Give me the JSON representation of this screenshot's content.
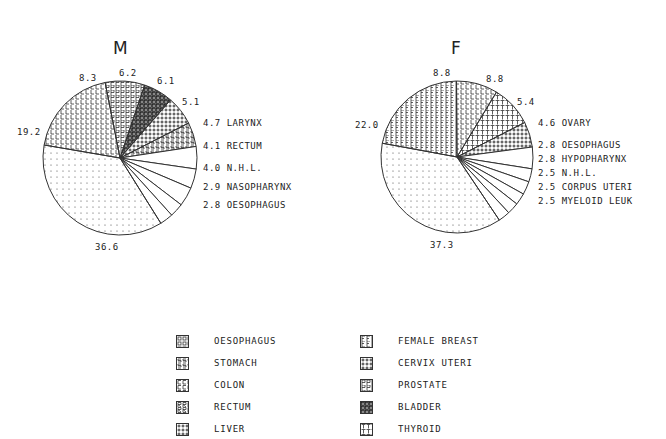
{
  "chart_data": [
    {
      "type": "pie",
      "title": "M",
      "slices": [
        {
          "label": "STOMACH",
          "value": 5.1,
          "pattern": "S"
        },
        {
          "label": "LARYNX",
          "value": 4.7,
          "pattern": "none"
        },
        {
          "label": "RECTUM",
          "value": 4.1,
          "pattern": "none"
        },
        {
          "label": "N.H.L.",
          "value": 4.0,
          "pattern": "none"
        },
        {
          "label": "NASOPHARYNX",
          "value": 2.9,
          "pattern": "none"
        },
        {
          "label": "OESOPHAGUS",
          "value": 2.8,
          "pattern": "none"
        },
        {
          "label": "Other",
          "value": 36.6,
          "pattern": "dots"
        },
        {
          "label": "LUNG",
          "value": 19.2,
          "pattern": "L"
        },
        {
          "label": "PROSTATE",
          "value": 8.3,
          "pattern": "P"
        },
        {
          "label": "BLADDER",
          "value": 6.2,
          "pattern": "B"
        },
        {
          "label": "LIVER",
          "value": 6.1,
          "pattern": "plus"
        }
      ]
    },
    {
      "type": "pie",
      "title": "F",
      "slices": [
        {
          "label": "CERVIX UTERI",
          "value": 5.4,
          "pattern": "plus"
        },
        {
          "label": "OVARY",
          "value": 4.6,
          "pattern": "none"
        },
        {
          "label": "OESOPHAGUS",
          "value": 2.8,
          "pattern": "none"
        },
        {
          "label": "HYPOPHARYNX",
          "value": 2.8,
          "pattern": "none"
        },
        {
          "label": "N.H.L.",
          "value": 2.5,
          "pattern": "none"
        },
        {
          "label": "CORPUS UTERI",
          "value": 2.5,
          "pattern": "none"
        },
        {
          "label": "MYELOID LEUK",
          "value": 2.5,
          "pattern": "none"
        },
        {
          "label": "Other",
          "value": 37.3,
          "pattern": "dots"
        },
        {
          "label": "FEMALE BREAST",
          "value": 22.0,
          "pattern": "F"
        },
        {
          "label": "LUNG",
          "value": 8.8,
          "pattern": "L"
        },
        {
          "label": "THYROID",
          "value": 8.8,
          "pattern": "T"
        }
      ]
    }
  ],
  "titles": {
    "male": "M",
    "female": "F"
  },
  "male_labels": {
    "l83": "8.3",
    "l62": "6.2",
    "l61": "6.1",
    "l51": "5.1",
    "l192": "19.2",
    "l366": "36.6",
    "r1": "4.7 LARYNX",
    "r2": "4.1 RECTUM",
    "r3": "4.0 N.H.L.",
    "r4": "2.9 NASOPHARYNX",
    "r5": "2.8 OESOPHAGUS"
  },
  "female_labels": {
    "l88a": "8.8",
    "l88b": "8.8",
    "l54": "5.4",
    "l220": "22.0",
    "l373": "37.3",
    "r1": "4.6 OVARY",
    "r2": "2.8 OESOPHAGUS",
    "r3": "2.8 HYPOPHARYNX",
    "r4": "2.5 N.H.L.",
    "r5": "2.5 CORPUS UTERI",
    "r6": "2.5 MYELOID LEUK"
  },
  "legend": {
    "left": [
      "OESOPHAGUS",
      "STOMACH",
      "COLON",
      "RECTUM",
      "LIVER"
    ],
    "right": [
      "FEMALE BREAST",
      "CERVIX UTERI",
      "PROSTATE",
      "BLADDER",
      "THYROID"
    ]
  }
}
